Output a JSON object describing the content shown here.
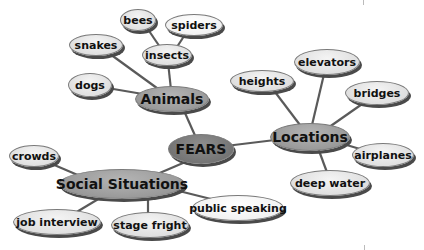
{
  "diagram": {
    "type": "mind-map",
    "root": {
      "label": "FEARS"
    },
    "categories": [
      {
        "label": "Animals",
        "children": [
          "dogs",
          "snakes",
          "insects"
        ],
        "subchildren": {
          "insects": [
            "bees",
            "spiders"
          ]
        }
      },
      {
        "label": "Locations",
        "children": [
          "heights",
          "elevators",
          "bridges",
          "airplanes",
          "deep water"
        ]
      },
      {
        "label": "Social Situations",
        "children": [
          "crowds",
          "job interview",
          "stage fright",
          "public speaking"
        ]
      }
    ]
  },
  "nodes": {
    "fears": "FEARS",
    "animals": "Animals",
    "locations": "Locations",
    "social": "Social Situations",
    "dogs": "dogs",
    "snakes": "snakes",
    "insects": "insects",
    "bees": "bees",
    "spiders": "spiders",
    "heights": "heights",
    "elevators": "elevators",
    "bridges": "bridges",
    "airplanes": "airplanes",
    "deep_water": "deep water",
    "crowds": "crowds",
    "job_interview": "job interview",
    "stage_fright": "stage fright",
    "public_speaking": "public speaking"
  },
  "colors": {
    "edge": "#5a5a5a",
    "root_fill": "#7a7a7a",
    "category_fill": "#a2a2a2",
    "leaf_fill": "#e2e2e2",
    "shadow": "#4a4a4a"
  }
}
